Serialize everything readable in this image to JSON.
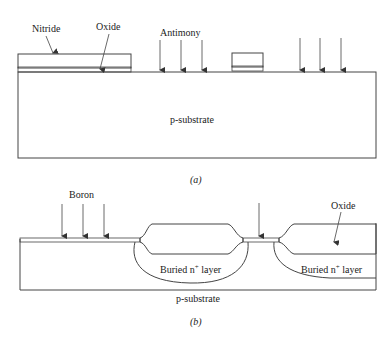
{
  "figure_a": {
    "caption": "(a)",
    "labels": {
      "nitride": "Nitride",
      "oxide": "Oxide",
      "antimony": "Antimony",
      "substrate": "p-substrate"
    }
  },
  "figure_b": {
    "caption": "(b)",
    "labels": {
      "boron": "Boron",
      "oxide": "Oxide",
      "buried_left": "Buried n",
      "buried_right": "Buried n",
      "superscript": "+",
      "layer": " layer",
      "substrate": "p-substrate"
    }
  },
  "colors": {
    "line": "#444444",
    "text": "#222222",
    "background": "#ffffff"
  }
}
